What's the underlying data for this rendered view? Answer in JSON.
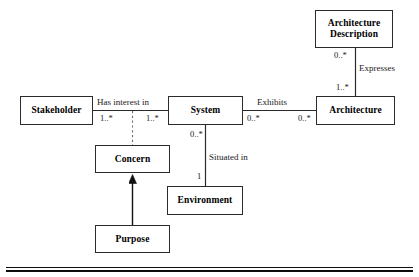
{
  "diagram": {
    "type": "uml-class-diagram",
    "background_color": "#ffffff",
    "line_color": "#2b2b2b",
    "text_color": "#000000",
    "classes": [
      {
        "id": "architecture-description",
        "label": "Architecture\nDescription",
        "line1": "Architecture",
        "line2": "Description",
        "x": 315,
        "y": 10,
        "w": 78,
        "h": 38
      },
      {
        "id": "stakeholder",
        "label": "Stakeholder",
        "x": 20,
        "y": 96,
        "w": 73,
        "h": 29
      },
      {
        "id": "system",
        "label": "System",
        "x": 168,
        "y": 96,
        "w": 75,
        "h": 29
      },
      {
        "id": "architecture",
        "label": "Architecture",
        "x": 316,
        "y": 96,
        "w": 79,
        "h": 29
      },
      {
        "id": "concern",
        "label": "Concern",
        "x": 95,
        "y": 145,
        "w": 75,
        "h": 28
      },
      {
        "id": "environment",
        "label": "Environment",
        "x": 167,
        "y": 186,
        "w": 76,
        "h": 29
      },
      {
        "id": "purpose",
        "label": "Purpose",
        "x": 95,
        "y": 225,
        "w": 75,
        "h": 28
      }
    ],
    "associations": [
      {
        "id": "has-interest-in",
        "label": "Has interest in",
        "from": "stakeholder",
        "to": "system",
        "source_multiplicity": "1..*",
        "target_multiplicity": "1..*"
      },
      {
        "id": "exhibits",
        "label": "Exhibits",
        "from": "system",
        "to": "architecture",
        "source_multiplicity": "0..*",
        "target_multiplicity": "0..*"
      },
      {
        "id": "expresses",
        "label": "Expresses",
        "from": "architecture-description",
        "to": "architecture",
        "source_multiplicity": "0..*",
        "target_multiplicity": "1..*"
      },
      {
        "id": "situated-in",
        "label": "Situated in",
        "from": "system",
        "to": "environment",
        "source_multiplicity": "0..*",
        "target_multiplicity": "1"
      }
    ],
    "generalizations": [
      {
        "id": "purpose-is-a-concern",
        "from": "purpose",
        "to": "concern",
        "style": "solid-filled-triangle"
      }
    ],
    "dependencies": [
      {
        "id": "concern-dashed-link",
        "from": "concern",
        "to": "has-interest-in",
        "style": "dashed"
      }
    ],
    "labels": {
      "has_interest_in": "Has interest in",
      "exhibits": "Exhibits",
      "expresses": "Expresses",
      "situated_in": "Situated in"
    },
    "multiplicities": {
      "stakeholder_side": "1..*",
      "system_side_interest": "1..*",
      "system_side_exhibits": "0..*",
      "architecture_side_exhibits": "0..*",
      "arch_desc_side_expresses": "0..*",
      "architecture_side_expresses": "1..*",
      "system_side_situated": "0..*",
      "environment_side_situated": "1"
    }
  }
}
